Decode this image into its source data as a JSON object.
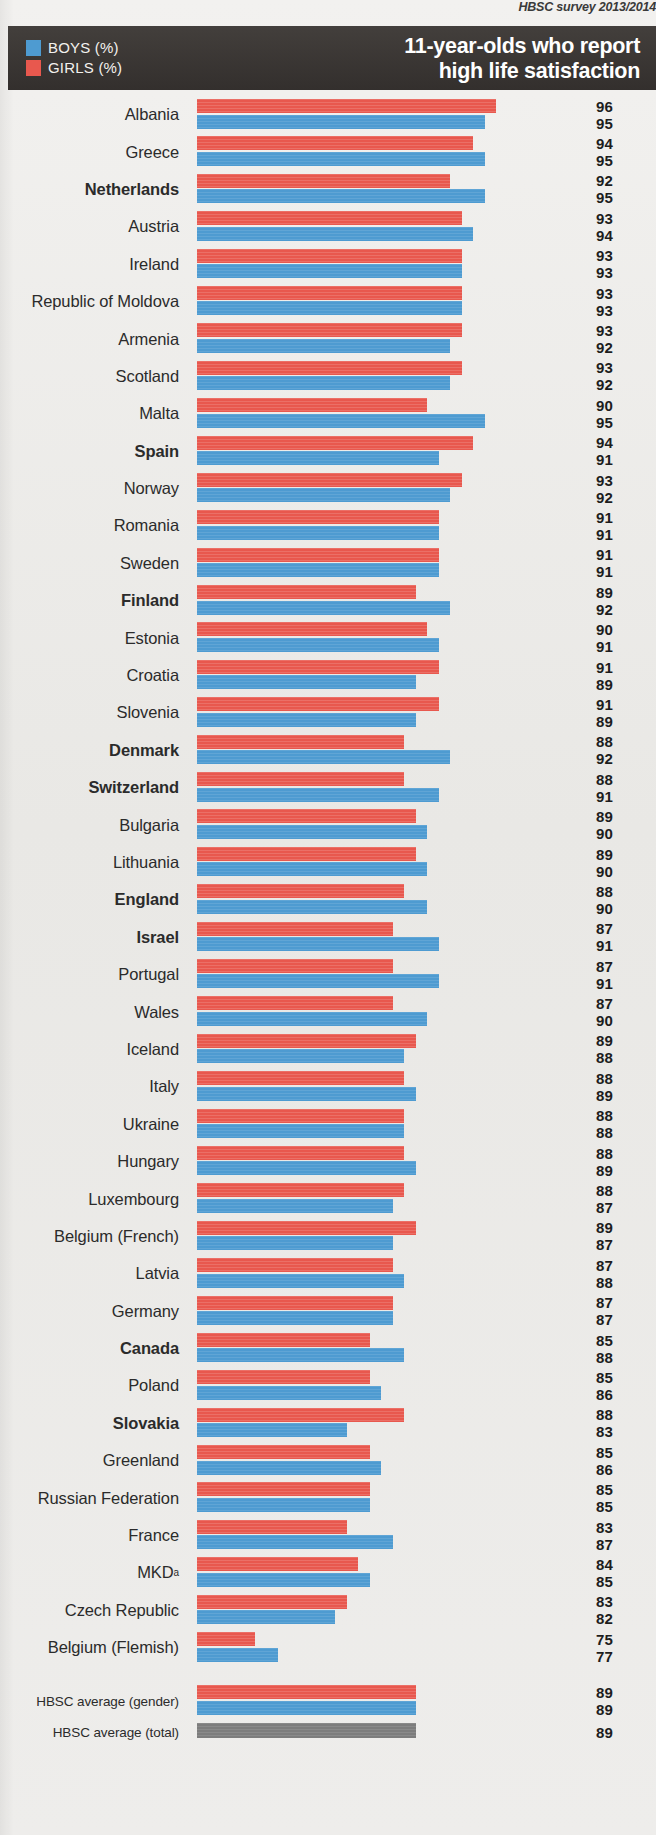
{
  "source_note": "HBSC survey 2013/2014",
  "header": {
    "title_line1": "11-year-olds who report",
    "title_line2": "high life satisfaction",
    "legend": [
      {
        "key": "boys",
        "label": "BOYS (%)",
        "color": "#4e9bd1"
      },
      {
        "key": "girls",
        "label": "GIRLS (%)",
        "color": "#e8584e"
      }
    ]
  },
  "chart_data": {
    "type": "bar",
    "orientation": "horizontal",
    "title": "11-year-olds who report high life satisfaction",
    "subtitle": "HBSC survey 2013/2014",
    "xlabel": "",
    "ylabel": "",
    "xlim": [
      70,
      100
    ],
    "grid": false,
    "legend_position": "top-left",
    "value_unit": "%",
    "series": [
      {
        "name": "GIRLS (%)",
        "color": "#e8584e"
      },
      {
        "name": "BOYS (%)",
        "color": "#4e9bd1"
      }
    ],
    "categories": [
      "Albania",
      "Greece",
      "Netherlands",
      "Austria",
      "Ireland",
      "Republic of Moldova",
      "Armenia",
      "Scotland",
      "Malta",
      "Spain",
      "Norway",
      "Romania",
      "Sweden",
      "Finland",
      "Estonia",
      "Croatia",
      "Slovenia",
      "Denmark",
      "Switzerland",
      "Bulgaria",
      "Lithuania",
      "England",
      "Israel",
      "Portugal",
      "Wales",
      "Iceland",
      "Italy",
      "Ukraine",
      "Hungary",
      "Luxembourg",
      "Belgium (French)",
      "Latvia",
      "Germany",
      "Canada",
      "Poland",
      "Slovakia",
      "Greenland",
      "Russian Federation",
      "France",
      "MKD",
      "Czech Republic",
      "Belgium (Flemish)"
    ],
    "girls": [
      96,
      94,
      92,
      93,
      93,
      93,
      93,
      93,
      90,
      94,
      93,
      91,
      91,
      89,
      90,
      91,
      91,
      88,
      88,
      89,
      89,
      88,
      87,
      87,
      87,
      89,
      88,
      88,
      88,
      88,
      89,
      87,
      87,
      85,
      85,
      88,
      85,
      85,
      83,
      84,
      83,
      75
    ],
    "boys": [
      95,
      95,
      95,
      94,
      93,
      93,
      92,
      92,
      95,
      91,
      92,
      91,
      91,
      92,
      91,
      89,
      89,
      92,
      91,
      90,
      90,
      90,
      91,
      91,
      90,
      88,
      89,
      88,
      89,
      87,
      87,
      88,
      87,
      88,
      86,
      83,
      86,
      85,
      87,
      85,
      82,
      77
    ],
    "averages": [
      {
        "label": "HBSC average (gender)",
        "girls": 89,
        "boys": 89
      },
      {
        "label": "HBSC average (total)",
        "total": 89
      }
    ]
  },
  "rows": [
    {
      "country": "Albania",
      "bold": false,
      "girls": 96,
      "boys": 95
    },
    {
      "country": "Greece",
      "bold": false,
      "girls": 94,
      "boys": 95
    },
    {
      "country": "Netherlands",
      "bold": true,
      "girls": 92,
      "boys": 95
    },
    {
      "country": "Austria",
      "bold": false,
      "girls": 93,
      "boys": 94
    },
    {
      "country": "Ireland",
      "bold": false,
      "girls": 93,
      "boys": 93
    },
    {
      "country": "Republic of Moldova",
      "bold": false,
      "girls": 93,
      "boys": 93
    },
    {
      "country": "Armenia",
      "bold": false,
      "girls": 93,
      "boys": 92
    },
    {
      "country": "Scotland",
      "bold": false,
      "girls": 93,
      "boys": 92
    },
    {
      "country": "Malta",
      "bold": false,
      "girls": 90,
      "boys": 95
    },
    {
      "country": "Spain",
      "bold": true,
      "girls": 94,
      "boys": 91
    },
    {
      "country": "Norway",
      "bold": false,
      "girls": 93,
      "boys": 92
    },
    {
      "country": "Romania",
      "bold": false,
      "girls": 91,
      "boys": 91
    },
    {
      "country": "Sweden",
      "bold": false,
      "girls": 91,
      "boys": 91
    },
    {
      "country": "Finland",
      "bold": true,
      "girls": 89,
      "boys": 92
    },
    {
      "country": "Estonia",
      "bold": false,
      "girls": 90,
      "boys": 91
    },
    {
      "country": "Croatia",
      "bold": false,
      "girls": 91,
      "boys": 89
    },
    {
      "country": "Slovenia",
      "bold": false,
      "girls": 91,
      "boys": 89
    },
    {
      "country": "Denmark",
      "bold": true,
      "girls": 88,
      "boys": 92
    },
    {
      "country": "Switzerland",
      "bold": true,
      "girls": 88,
      "boys": 91
    },
    {
      "country": "Bulgaria",
      "bold": false,
      "girls": 89,
      "boys": 90
    },
    {
      "country": "Lithuania",
      "bold": false,
      "girls": 89,
      "boys": 90
    },
    {
      "country": "England",
      "bold": true,
      "girls": 88,
      "boys": 90
    },
    {
      "country": "Israel",
      "bold": true,
      "girls": 87,
      "boys": 91
    },
    {
      "country": "Portugal",
      "bold": false,
      "girls": 87,
      "boys": 91
    },
    {
      "country": "Wales",
      "bold": false,
      "girls": 87,
      "boys": 90
    },
    {
      "country": "Iceland",
      "bold": false,
      "girls": 89,
      "boys": 88
    },
    {
      "country": "Italy",
      "bold": false,
      "girls": 88,
      "boys": 89
    },
    {
      "country": "Ukraine",
      "bold": false,
      "girls": 88,
      "boys": 88
    },
    {
      "country": "Hungary",
      "bold": false,
      "girls": 88,
      "boys": 89
    },
    {
      "country": "Luxembourg",
      "bold": false,
      "girls": 88,
      "boys": 87
    },
    {
      "country": "Belgium (French)",
      "bold": false,
      "girls": 89,
      "boys": 87
    },
    {
      "country": "Latvia",
      "bold": false,
      "girls": 87,
      "boys": 88
    },
    {
      "country": "Germany",
      "bold": false,
      "girls": 87,
      "boys": 87
    },
    {
      "country": "Canada",
      "bold": true,
      "girls": 85,
      "boys": 88
    },
    {
      "country": "Poland",
      "bold": false,
      "girls": 85,
      "boys": 86
    },
    {
      "country": "Slovakia",
      "bold": true,
      "girls": 88,
      "boys": 83
    },
    {
      "country": "Greenland",
      "bold": false,
      "girls": 85,
      "boys": 86
    },
    {
      "country": "Russian Federation",
      "bold": false,
      "girls": 85,
      "boys": 85
    },
    {
      "country": "France",
      "bold": false,
      "girls": 83,
      "boys": 87
    },
    {
      "country": "MKD",
      "superscript": "a",
      "bold": false,
      "girls": 84,
      "boys": 85
    },
    {
      "country": "Czech Republic",
      "bold": false,
      "girls": 83,
      "boys": 82
    },
    {
      "country": "Belgium (Flemish)",
      "bold": false,
      "girls": 75,
      "boys": 77
    }
  ],
  "averages": [
    {
      "label": "HBSC average (gender)",
      "girls": 89,
      "boys": 89
    },
    {
      "label": "HBSC average (total)",
      "total": 89
    }
  ],
  "scale": {
    "min": 70,
    "px_per_unit": 11.5,
    "bar_start_px": 197
  }
}
